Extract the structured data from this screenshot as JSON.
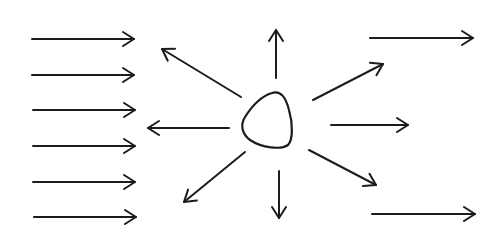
{
  "diagram": {
    "colors": {
      "background": "#ffffff",
      "stroke": "#1c1c1c"
    },
    "incident_arrows": [
      {
        "x1": 32,
        "y1": 39,
        "x2": 134,
        "y2": 39
      },
      {
        "x1": 32,
        "y1": 75,
        "x2": 134,
        "y2": 75
      },
      {
        "x1": 33,
        "y1": 110,
        "x2": 135,
        "y2": 110
      },
      {
        "x1": 33,
        "y1": 146,
        "x2": 135,
        "y2": 146
      },
      {
        "x1": 33,
        "y1": 182,
        "x2": 135,
        "y2": 182
      },
      {
        "x1": 34,
        "y1": 217,
        "x2": 136,
        "y2": 217
      }
    ],
    "scattered_arrows": [
      {
        "name": "up",
        "x1": 276,
        "y1": 78,
        "x2": 276,
        "y2": 30
      },
      {
        "name": "down",
        "x1": 279,
        "y1": 171,
        "x2": 279,
        "y2": 218
      },
      {
        "name": "left",
        "x1": 229,
        "y1": 128,
        "x2": 148,
        "y2": 128
      },
      {
        "name": "right",
        "x1": 331,
        "y1": 125,
        "x2": 408,
        "y2": 125
      },
      {
        "name": "upper-left",
        "x1": 241,
        "y1": 97,
        "x2": 162,
        "y2": 49
      },
      {
        "name": "lower-left",
        "x1": 245,
        "y1": 152,
        "x2": 184,
        "y2": 202
      },
      {
        "name": "upper-right",
        "x1": 313,
        "y1": 100,
        "x2": 383,
        "y2": 64
      },
      {
        "name": "lower-right",
        "x1": 309,
        "y1": 150,
        "x2": 376,
        "y2": 185
      }
    ],
    "transmitted_arrows": [
      {
        "x1": 370,
        "y1": 38,
        "x2": 473,
        "y2": 38
      },
      {
        "x1": 372,
        "y1": 214,
        "x2": 475,
        "y2": 214
      }
    ],
    "scatterer": {
      "shape": "rounded-triangle",
      "path": "M 272 93 C 281 90 286 98 289 110 C 293 124 293 140 288 145 C 281 150 262 148 250 140 C 242 134 240 125 245 117 C 252 106 262 96 272 93 Z"
    },
    "arrowhead": {
      "length": 11,
      "half_width": 7
    }
  }
}
